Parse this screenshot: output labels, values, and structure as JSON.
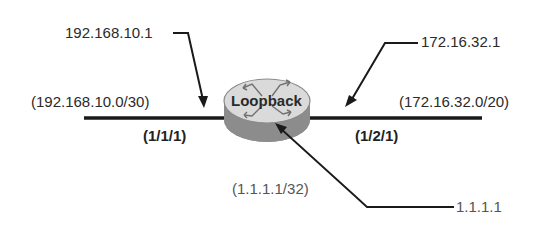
{
  "diagram": {
    "router": {
      "label": "Loopback",
      "colors": {
        "top": "#d9d9d9",
        "side": "#8c8c8c",
        "arrows": "#6a6a6a"
      }
    },
    "left_interface": {
      "ip": "192.168.10.1",
      "subnet": "(192.168.10.0/30)",
      "port": "(1/1/1)"
    },
    "right_interface": {
      "ip": "172.16.32.1",
      "subnet": "(172.16.32.0/20)",
      "port": "(1/2/1)"
    },
    "loopback": {
      "ip": "1.1.1.1",
      "subnet": "(1.1.1.1/32)"
    },
    "line_color": "#1a1a1a"
  }
}
